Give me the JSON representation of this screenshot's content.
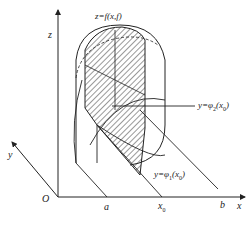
{
  "diagram": {
    "type": "3D volume by cross-sections (double integral)",
    "axes": {
      "z": "z",
      "y": "y",
      "x": "x",
      "origin": "O"
    },
    "surface_label": "z=f(x,f)",
    "curve_upper_label_parts": {
      "lhs": "y=φ",
      "sub": "2",
      "arg": "(x",
      "argsub": "0",
      "close": ")"
    },
    "curve_lower_label_parts": {
      "lhs": "y=φ",
      "sub": "1",
      "arg": "(x",
      "argsub": "0",
      "close": ")"
    },
    "x_ticks": {
      "a": "a",
      "x0": "x",
      "x0_sub": "0",
      "b": "b"
    },
    "colors": {
      "stroke": "#222222",
      "hatch": "#333333",
      "background": "#ffffff"
    }
  }
}
